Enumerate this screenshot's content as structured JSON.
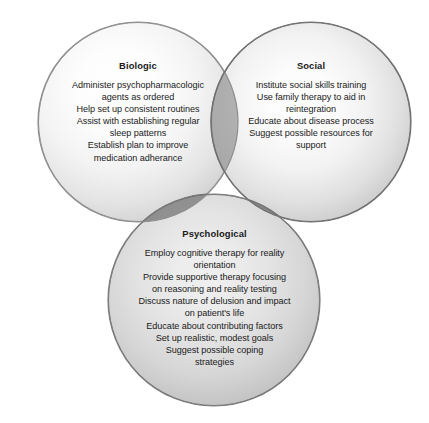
{
  "figure": {
    "type": "venn-diagram",
    "circle_count": 3,
    "background_color": "#ffffff",
    "text_color": "#1a1a1a"
  },
  "circles": [
    {
      "id": "biologic",
      "title": "Biologic",
      "fill_center_color": "#ffffff",
      "fill_edge_color": "#a2a2a2",
      "stroke_color": "#8e8e8e",
      "center_x": 138,
      "center_y": 122,
      "radius": 100,
      "items": [
        "Administer psychopharmacologic\nagents as ordered",
        "Help set up consistent routines",
        "Assist with establishing regular\nsleep patterns",
        "Establish plan to improve\nmedication adherance"
      ]
    },
    {
      "id": "social",
      "title": "Social",
      "fill_center_color": "#ffffff",
      "fill_edge_color": "#979797",
      "stroke_color": "#6f6f6f",
      "center_x": 311,
      "center_y": 122,
      "radius": 100,
      "items": [
        "Institute social skills training",
        "Use family therapy to aid in\nreintegration",
        "Educate about disease process",
        "Suggest possible resources for\nsupport"
      ]
    },
    {
      "id": "psychological",
      "title": "Psychological",
      "fill_center_color": "#f0f0f0",
      "fill_edge_color": "#9b9b9b",
      "stroke_color": "#7a7a7a",
      "center_x": 214,
      "center_y": 300,
      "radius": 106,
      "items": [
        "Employ cognitive therapy for reality\norientation",
        "Provide supportive therapy focusing\non reasoning and reality testing",
        "Discuss nature of delusion and impact\non patient's life",
        "Educate about contributing factors",
        "Set up realistic, modest goals",
        "Suggest possible coping\nstrategies"
      ]
    }
  ],
  "overlaps": {
    "biologic_psychological_color": "#8f8f8f",
    "social_psychological_color": "#868686",
    "biologic_social_color": "#9a9a9a"
  }
}
